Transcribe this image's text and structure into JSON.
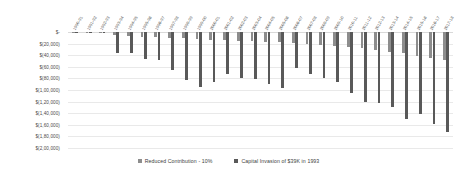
{
  "chart_data": {
    "type": "bar",
    "title": "",
    "xlabel": "",
    "ylabel": "",
    "ylim": [
      -200000,
      0
    ],
    "ytick_step": 20000,
    "grid": true,
    "legend_position": "bottom",
    "orientation": "vertical",
    "categories": [
      "1990-91",
      "1991-92",
      "1992-93",
      "1993-94",
      "1994-95",
      "1995-96",
      "1996-97",
      "1997-98",
      "1998-99",
      "1999-00",
      "2000-01",
      "2001-02",
      "2002-03",
      "2003-04",
      "2004-05",
      "2005-06",
      "2006-07",
      "2007-08",
      "2008-09",
      "2009-10",
      "2010-11",
      "2011-12",
      "2012-13",
      "2013-14",
      "2014-15",
      "2015-16",
      "2016-17",
      "2017-18"
    ],
    "ytick_labels": [
      "$-",
      "$(20,000)",
      "$(40,000)",
      "$(60,000)",
      "$(80,000)",
      "$(1,00,000)",
      "$(1,20,000)",
      "$(1,40,000)",
      "$(1,60,000)",
      "$(1,80,000)",
      "$(2,00,000)"
    ],
    "ytick_values": [
      0,
      -20000,
      -40000,
      -60000,
      -80000,
      -100000,
      -120000,
      -140000,
      -160000,
      -180000,
      -200000
    ],
    "series": [
      {
        "name": "Reduced Contribution  - 10%",
        "color": "#8d8d8d",
        "values": [
          -1500,
          -2000,
          -2500,
          -6000,
          -6500,
          -8000,
          -9000,
          -10000,
          -11000,
          -12000,
          -13500,
          -14000,
          -15000,
          -16000,
          -17000,
          -18000,
          -19500,
          -21000,
          -22000,
          -24000,
          -26000,
          -28000,
          -31000,
          -34000,
          -37000,
          -41000,
          -44000,
          -48000
        ]
      },
      {
        "name": "Capital Invasion of $39K in 1993",
        "color": "#595959",
        "values": [
          -1500,
          -2000,
          -2500,
          -37000,
          -36000,
          -46000,
          -49000,
          -65000,
          -82000,
          -94000,
          -86000,
          -73000,
          -80000,
          -81000,
          -90000,
          -96000,
          -62000,
          -72000,
          -79000,
          -87000,
          -105000,
          -120000,
          -122000,
          -130000,
          -150000,
          -142000,
          -158000,
          -172000
        ]
      }
    ]
  },
  "legend": {
    "items": [
      {
        "label": "Reduced Contribution  - 10%",
        "color": "#8d8d8d"
      },
      {
        "label": "Capital Invasion of $39K in 1993",
        "color": "#595959"
      }
    ]
  }
}
